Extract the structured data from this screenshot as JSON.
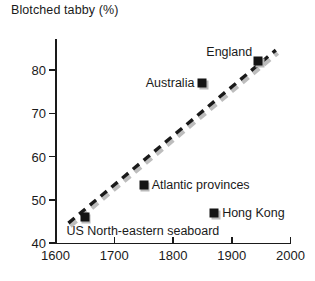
{
  "chart_data": {
    "type": "scatter",
    "title": "",
    "ylabel": "Blotched tabby (%)",
    "xlabel": "",
    "xlim": [
      1600,
      2000
    ],
    "ylim": [
      40,
      85
    ],
    "xticks": [
      1600,
      1700,
      1800,
      1900,
      2000
    ],
    "yticks": [
      40,
      50,
      60,
      70,
      80
    ],
    "xtick_labels": [
      "1600",
      "1700",
      "1800",
      "1900",
      "2000"
    ],
    "ytick_labels": [
      "40",
      "50",
      "60",
      "70",
      "80"
    ],
    "grid": false,
    "legend": "none",
    "points": [
      {
        "label": "US North-eastern seaboard",
        "x": 1650,
        "y": 46,
        "label_position": "below"
      },
      {
        "label": "Atlantic provinces",
        "x": 1750,
        "y": 53.5,
        "label_position": "right"
      },
      {
        "label": "Hong Kong",
        "x": 1870,
        "y": 47,
        "label_position": "right"
      },
      {
        "label": "Australia",
        "x": 1850,
        "y": 77,
        "label_position": "left"
      },
      {
        "label": "England",
        "x": 1945,
        "y": 82,
        "label_position": "above-left"
      }
    ],
    "trend_line": {
      "style": "dashed",
      "color": "#1a1a1a",
      "x_start": 1622,
      "y_start": 44.6,
      "x_end": 1975,
      "y_end": 84.6
    }
  }
}
